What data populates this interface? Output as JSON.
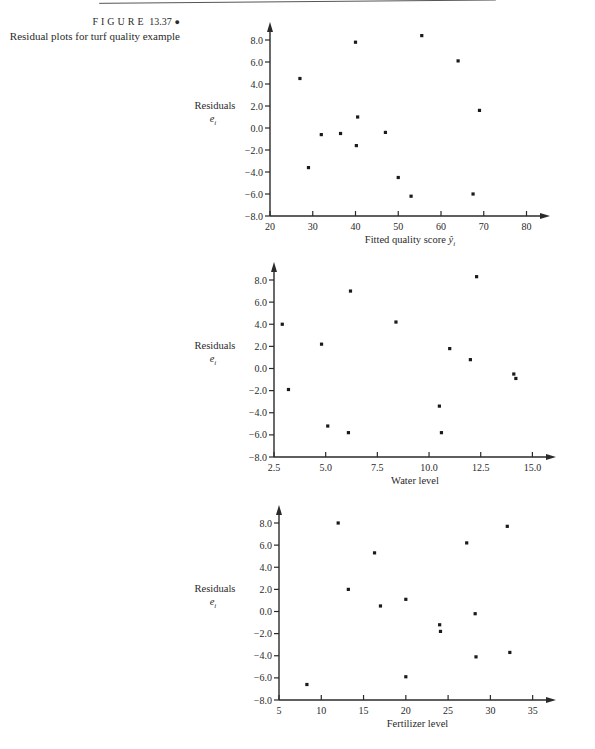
{
  "caption": {
    "figure_label": "FIGURE",
    "figure_number": "13.37",
    "bullet": "●",
    "title": "Residual plots for turf quality example"
  },
  "chart_data": [
    {
      "type": "scatter",
      "title": "",
      "xlabel": "Fitted quality score ŷi",
      "ylabel": "Residuals ei",
      "xlim": [
        20,
        80
      ],
      "ylim": [
        -8.0,
        8.0
      ],
      "xticks": [
        "20",
        "30",
        "40",
        "50",
        "60",
        "70",
        "80"
      ],
      "yticks": [
        "8.0",
        "6.0",
        "4.0",
        "2.0",
        "0.0",
        "-2.0",
        "-4.0",
        "-6.0",
        "-8.0"
      ],
      "grid": false,
      "points": [
        {
          "x": 27.0,
          "y": 4.5
        },
        {
          "x": 29.0,
          "y": -3.6
        },
        {
          "x": 32.0,
          "y": -0.6
        },
        {
          "x": 36.5,
          "y": -0.5
        },
        {
          "x": 40.0,
          "y": 7.8
        },
        {
          "x": 40.5,
          "y": 1.0
        },
        {
          "x": 40.2,
          "y": -1.6
        },
        {
          "x": 47.0,
          "y": -0.4
        },
        {
          "x": 50.0,
          "y": -4.5
        },
        {
          "x": 53.0,
          "y": -6.2
        },
        {
          "x": 55.5,
          "y": 8.4
        },
        {
          "x": 64.0,
          "y": 6.1
        },
        {
          "x": 67.5,
          "y": -6.0
        },
        {
          "x": 69.0,
          "y": 1.6
        }
      ]
    },
    {
      "type": "scatter",
      "title": "",
      "xlabel": "Water level",
      "ylabel": "Residuals ei",
      "xlim": [
        2.5,
        15.0
      ],
      "ylim": [
        -8.0,
        8.0
      ],
      "xticks": [
        "2.5",
        "5.0",
        "7.5",
        "10.0",
        "12.5",
        "15.0"
      ],
      "yticks": [
        "8.0",
        "6.0",
        "4.0",
        "2.0",
        "0.0",
        "-2.0",
        "-4.0",
        "-6.0",
        "-8.0"
      ],
      "grid": false,
      "points": [
        {
          "x": 2.9,
          "y": 4.0
        },
        {
          "x": 3.2,
          "y": -1.9
        },
        {
          "x": 4.8,
          "y": 2.2
        },
        {
          "x": 5.1,
          "y": -5.2
        },
        {
          "x": 6.1,
          "y": -5.8
        },
        {
          "x": 6.2,
          "y": 7.0
        },
        {
          "x": 8.4,
          "y": 4.2
        },
        {
          "x": 10.5,
          "y": -3.4
        },
        {
          "x": 10.6,
          "y": -5.8
        },
        {
          "x": 11.0,
          "y": 1.8
        },
        {
          "x": 12.0,
          "y": 0.8
        },
        {
          "x": 12.3,
          "y": 8.3
        },
        {
          "x": 14.1,
          "y": -0.5
        },
        {
          "x": 14.2,
          "y": -0.9
        }
      ]
    },
    {
      "type": "scatter",
      "title": "",
      "xlabel": "Fertilizer level",
      "ylabel": "Residuals ei",
      "xlim": [
        5,
        35
      ],
      "ylim": [
        -8.0,
        8.0
      ],
      "xticks": [
        "5",
        "10",
        "15",
        "20",
        "25",
        "30",
        "35"
      ],
      "yticks": [
        "8.0",
        "6.0",
        "4.0",
        "2.0",
        "0.0",
        "-2.0",
        "-4.0",
        "-6.0",
        "-8.0"
      ],
      "grid": false,
      "points": [
        {
          "x": 8.3,
          "y": -6.6
        },
        {
          "x": 12.0,
          "y": 8.0
        },
        {
          "x": 13.2,
          "y": 2.0
        },
        {
          "x": 16.3,
          "y": 5.3
        },
        {
          "x": 17.0,
          "y": 0.5
        },
        {
          "x": 20.0,
          "y": 1.1
        },
        {
          "x": 20.0,
          "y": -5.9
        },
        {
          "x": 24.0,
          "y": -1.2
        },
        {
          "x": 24.1,
          "y": -1.8
        },
        {
          "x": 27.2,
          "y": 6.2
        },
        {
          "x": 28.2,
          "y": -0.2
        },
        {
          "x": 28.3,
          "y": -4.1
        },
        {
          "x": 32.0,
          "y": 7.7
        },
        {
          "x": 32.3,
          "y": -3.7
        }
      ]
    }
  ],
  "charts_layout": [
    {
      "top": 0,
      "axis_x0": 270,
      "axis_x1": 540,
      "plot_top": 40,
      "plot_bottom": 216,
      "x_min": 20,
      "x_max": 80,
      "xlabel_main": "Fitted quality score ",
      "xlabel_sym": "ŷ",
      "xlabel_sub": "i"
    },
    {
      "top": 0,
      "axis_x0": 274,
      "axis_x1": 546,
      "plot_top": 280,
      "plot_bottom": 457,
      "x_min": 2.5,
      "x_max": 15.0,
      "xlabel_main": "Water level",
      "xlabel_sym": "",
      "xlabel_sub": ""
    },
    {
      "top": 0,
      "axis_x0": 279,
      "axis_x1": 546,
      "plot_top": 523,
      "plot_bottom": 700,
      "x_min": 5,
      "x_max": 35,
      "xlabel_main": "Fertilizer level",
      "xlabel_sym": "",
      "xlabel_sub": ""
    }
  ],
  "labels": {
    "residuals": "Residuals",
    "e_symbol": "e",
    "e_sub": "i"
  }
}
